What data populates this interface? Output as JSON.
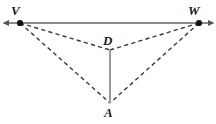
{
  "figure": {
    "width": 216,
    "height": 124,
    "background_color": "#ffffff",
    "colors": {
      "solid_line": "#8c8c8c",
      "dashed_line": "#3a3a3a",
      "point": "#111111",
      "label_text": "#1a1a1a"
    },
    "labels": {
      "V": "V",
      "W": "W",
      "D": "D",
      "A": "A"
    },
    "points": [
      {
        "name": "V",
        "x": 20,
        "y": 23,
        "dot": true,
        "label_position": "above-left"
      },
      {
        "name": "W",
        "x": 199,
        "y": 23,
        "dot": true,
        "label_position": "above-left"
      },
      {
        "name": "D",
        "x": 110,
        "y": 50,
        "dot": false,
        "label_position": "above"
      },
      {
        "name": "A",
        "x": 110,
        "y": 103,
        "dot": false,
        "label_position": "below"
      }
    ],
    "segments": [
      {
        "name": "line-VW",
        "from": "V",
        "to": "W",
        "style": "solid",
        "color": "#8c8c8c",
        "width": 2,
        "arrows": "both",
        "x1": 6,
        "y1": 23,
        "x2": 211,
        "y2": 23
      },
      {
        "name": "segment-DA",
        "from": "D",
        "to": "A",
        "style": "solid",
        "color": "#8c8c8c",
        "width": 2,
        "arrows": "none",
        "x1": 110,
        "y1": 50,
        "x2": 110,
        "y2": 103
      },
      {
        "name": "segment-VD",
        "from": "V",
        "to": "D",
        "style": "dashed",
        "color": "#3a3a3a",
        "width": 1.4,
        "arrows": "none",
        "x1": 20,
        "y1": 23,
        "x2": 110,
        "y2": 50
      },
      {
        "name": "segment-WD",
        "from": "W",
        "to": "D",
        "style": "dashed",
        "color": "#3a3a3a",
        "width": 1.4,
        "arrows": "none",
        "x1": 199,
        "y1": 23,
        "x2": 110,
        "y2": 50
      },
      {
        "name": "segment-VA",
        "from": "V",
        "to": "A",
        "style": "dashed",
        "color": "#3a3a3a",
        "width": 1.4,
        "arrows": "none",
        "x1": 20,
        "y1": 23,
        "x2": 110,
        "y2": 103
      },
      {
        "name": "segment-WA",
        "from": "W",
        "to": "A",
        "style": "dashed",
        "color": "#3a3a3a",
        "width": 1.4,
        "arrows": "none",
        "x1": 199,
        "y1": 23,
        "x2": 110,
        "y2": 103
      }
    ]
  }
}
